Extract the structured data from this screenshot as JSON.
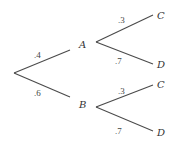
{
  "diagram": {
    "type": "probability-tree",
    "nodes": {
      "A": "A",
      "B": "B",
      "A_C": "C",
      "A_D": "D",
      "B_C": "C",
      "B_D": "D"
    },
    "edges": {
      "root_A": ".4",
      "root_B": ".6",
      "A_C": ".3",
      "A_D": ".7",
      "B_C": ".3",
      "B_D": ".7"
    },
    "colors": {
      "line": "#4a4a4a",
      "text": "#333333",
      "background": "#ffffff"
    }
  }
}
